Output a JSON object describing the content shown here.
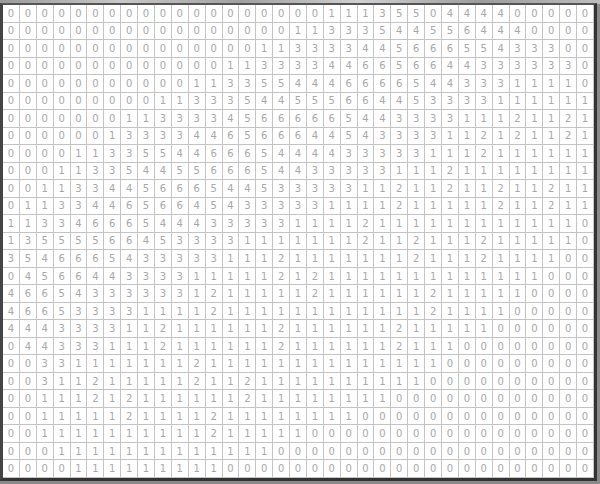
{
  "grid": {
    "rows": 27,
    "cols": 35,
    "colors": {
      "text": "#a8a8a8",
      "gridline": "#c4c4c4",
      "frame": "#333333",
      "background": "#ffffff"
    },
    "values": [
      [
        0,
        0,
        0,
        0,
        0,
        0,
        0,
        0,
        0,
        0,
        0,
        0,
        0,
        0,
        0,
        0,
        0,
        0,
        0,
        1,
        1,
        1,
        3,
        5,
        5,
        0,
        4,
        4,
        4,
        4,
        0,
        0,
        0,
        0,
        0
      ],
      [
        0,
        0,
        0,
        0,
        0,
        0,
        0,
        0,
        0,
        0,
        0,
        0,
        0,
        0,
        0,
        0,
        0,
        1,
        1,
        3,
        3,
        3,
        5,
        4,
        4,
        5,
        5,
        6,
        4,
        4,
        4,
        0,
        0,
        0,
        0
      ],
      [
        0,
        0,
        0,
        0,
        0,
        0,
        0,
        0,
        0,
        0,
        0,
        0,
        0,
        0,
        0,
        1,
        1,
        3,
        3,
        3,
        3,
        4,
        4,
        5,
        6,
        6,
        6,
        5,
        5,
        4,
        3,
        3,
        3,
        0,
        0
      ],
      [
        0,
        0,
        0,
        0,
        0,
        0,
        0,
        0,
        0,
        0,
        0,
        0,
        0,
        1,
        1,
        3,
        3,
        3,
        3,
        4,
        4,
        6,
        6,
        5,
        6,
        6,
        4,
        4,
        3,
        3,
        3,
        3,
        3,
        3,
        0
      ],
      [
        0,
        0,
        0,
        0,
        0,
        0,
        0,
        0,
        0,
        0,
        0,
        1,
        1,
        3,
        3,
        5,
        5,
        4,
        4,
        4,
        6,
        6,
        6,
        6,
        5,
        4,
        4,
        3,
        3,
        3,
        1,
        1,
        1,
        1,
        0
      ],
      [
        0,
        0,
        0,
        0,
        0,
        0,
        0,
        0,
        0,
        1,
        1,
        3,
        3,
        3,
        5,
        4,
        4,
        5,
        5,
        5,
        6,
        6,
        4,
        4,
        5,
        3,
        3,
        3,
        3,
        1,
        1,
        1,
        1,
        1,
        1
      ],
      [
        0,
        0,
        0,
        0,
        0,
        0,
        0,
        1,
        1,
        3,
        3,
        3,
        3,
        4,
        5,
        6,
        6,
        6,
        6,
        6,
        5,
        4,
        4,
        3,
        3,
        3,
        3,
        1,
        1,
        1,
        2,
        1,
        1,
        2,
        1
      ],
      [
        0,
        0,
        0,
        0,
        0,
        0,
        1,
        3,
        3,
        3,
        3,
        4,
        4,
        6,
        5,
        6,
        6,
        6,
        4,
        4,
        5,
        4,
        3,
        3,
        3,
        3,
        1,
        1,
        2,
        1,
        2,
        1,
        1,
        2,
        1
      ],
      [
        0,
        0,
        0,
        0,
        1,
        1,
        3,
        3,
        5,
        5,
        4,
        4,
        6,
        6,
        6,
        5,
        4,
        4,
        4,
        4,
        3,
        3,
        3,
        3,
        3,
        1,
        1,
        1,
        2,
        1,
        1,
        1,
        1,
        1,
        1
      ],
      [
        0,
        0,
        0,
        1,
        1,
        3,
        3,
        5,
        4,
        4,
        5,
        5,
        6,
        6,
        6,
        5,
        4,
        4,
        3,
        3,
        3,
        3,
        3,
        1,
        1,
        1,
        2,
        1,
        1,
        1,
        1,
        1,
        1,
        1,
        1
      ],
      [
        0,
        0,
        1,
        1,
        3,
        3,
        4,
        4,
        5,
        6,
        6,
        6,
        5,
        4,
        4,
        5,
        3,
        3,
        3,
        3,
        3,
        1,
        1,
        2,
        1,
        1,
        2,
        1,
        1,
        2,
        1,
        1,
        2,
        1,
        1
      ],
      [
        0,
        1,
        1,
        3,
        3,
        4,
        4,
        6,
        5,
        6,
        6,
        4,
        5,
        4,
        3,
        3,
        3,
        3,
        3,
        1,
        1,
        1,
        1,
        2,
        1,
        1,
        1,
        1,
        1,
        2,
        1,
        1,
        2,
        1,
        1
      ],
      [
        1,
        1,
        3,
        3,
        4,
        6,
        6,
        6,
        5,
        4,
        4,
        4,
        3,
        3,
        3,
        3,
        3,
        1,
        1,
        1,
        1,
        2,
        1,
        1,
        1,
        1,
        1,
        1,
        1,
        1,
        1,
        1,
        1,
        1,
        0
      ],
      [
        1,
        3,
        5,
        5,
        5,
        5,
        6,
        6,
        4,
        5,
        3,
        3,
        3,
        3,
        1,
        1,
        1,
        1,
        1,
        1,
        1,
        2,
        1,
        1,
        2,
        1,
        1,
        1,
        2,
        1,
        1,
        1,
        1,
        1,
        0
      ],
      [
        3,
        5,
        4,
        6,
        6,
        6,
        5,
        4,
        3,
        3,
        3,
        3,
        3,
        1,
        1,
        1,
        2,
        1,
        1,
        1,
        1,
        1,
        1,
        1,
        2,
        1,
        1,
        1,
        2,
        1,
        1,
        1,
        1,
        0,
        0
      ],
      [
        0,
        4,
        5,
        6,
        6,
        4,
        4,
        3,
        3,
        3,
        3,
        1,
        1,
        1,
        1,
        1,
        2,
        1,
        2,
        1,
        1,
        1,
        1,
        1,
        1,
        1,
        1,
        1,
        1,
        1,
        1,
        1,
        0,
        0,
        0
      ],
      [
        4,
        6,
        6,
        5,
        4,
        3,
        3,
        3,
        3,
        3,
        3,
        1,
        2,
        1,
        1,
        1,
        1,
        1,
        2,
        1,
        1,
        1,
        1,
        1,
        1,
        2,
        1,
        1,
        1,
        1,
        1,
        0,
        0,
        0,
        0
      ],
      [
        4,
        6,
        6,
        5,
        3,
        3,
        3,
        3,
        1,
        1,
        1,
        1,
        2,
        1,
        1,
        1,
        1,
        1,
        1,
        1,
        1,
        1,
        1,
        1,
        1,
        2,
        1,
        1,
        1,
        1,
        0,
        0,
        0,
        0,
        0
      ],
      [
        4,
        4,
        4,
        3,
        3,
        3,
        3,
        1,
        1,
        2,
        1,
        1,
        1,
        1,
        1,
        1,
        2,
        1,
        1,
        1,
        1,
        1,
        1,
        2,
        1,
        1,
        1,
        1,
        1,
        0,
        0,
        0,
        0,
        0,
        0
      ],
      [
        0,
        4,
        4,
        3,
        3,
        3,
        1,
        1,
        1,
        2,
        1,
        1,
        1,
        1,
        1,
        1,
        2,
        1,
        1,
        1,
        1,
        1,
        1,
        2,
        1,
        1,
        1,
        0,
        0,
        0,
        0,
        0,
        0,
        0,
        0
      ],
      [
        0,
        0,
        3,
        3,
        1,
        1,
        1,
        1,
        1,
        1,
        1,
        2,
        1,
        1,
        1,
        1,
        1,
        1,
        1,
        1,
        1,
        1,
        1,
        1,
        1,
        1,
        0,
        0,
        0,
        0,
        0,
        0,
        0,
        0,
        0
      ],
      [
        0,
        0,
        3,
        1,
        1,
        2,
        1,
        1,
        1,
        1,
        1,
        2,
        1,
        1,
        2,
        1,
        1,
        1,
        1,
        1,
        1,
        1,
        1,
        1,
        1,
        0,
        0,
        0,
        0,
        0,
        0,
        0,
        0,
        0,
        0
      ],
      [
        0,
        0,
        1,
        1,
        1,
        2,
        1,
        2,
        1,
        1,
        1,
        1,
        1,
        1,
        2,
        1,
        1,
        1,
        1,
        1,
        1,
        1,
        1,
        0,
        0,
        0,
        0,
        0,
        0,
        0,
        0,
        0,
        0,
        0,
        0
      ],
      [
        0,
        0,
        1,
        1,
        1,
        1,
        1,
        2,
        1,
        1,
        1,
        1,
        2,
        1,
        1,
        1,
        1,
        1,
        1,
        1,
        1,
        0,
        0,
        0,
        0,
        0,
        0,
        0,
        0,
        0,
        0,
        0,
        0,
        0,
        0
      ],
      [
        0,
        0,
        1,
        1,
        1,
        1,
        1,
        1,
        1,
        1,
        1,
        1,
        2,
        1,
        1,
        1,
        1,
        1,
        0,
        0,
        0,
        0,
        0,
        0,
        0,
        0,
        0,
        0,
        0,
        0,
        0,
        0,
        0,
        0,
        0
      ],
      [
        0,
        0,
        0,
        1,
        1,
        1,
        1,
        1,
        1,
        1,
        1,
        1,
        1,
        1,
        1,
        1,
        0,
        0,
        0,
        0,
        0,
        0,
        0,
        0,
        0,
        0,
        0,
        0,
        0,
        0,
        0,
        0,
        0,
        0,
        0
      ],
      [
        0,
        0,
        0,
        0,
        1,
        1,
        1,
        1,
        1,
        1,
        1,
        1,
        1,
        0,
        0,
        0,
        0,
        0,
        0,
        0,
        0,
        0,
        0,
        0,
        0,
        0,
        0,
        0,
        0,
        0,
        0,
        0,
        0,
        0,
        0
      ]
    ]
  }
}
